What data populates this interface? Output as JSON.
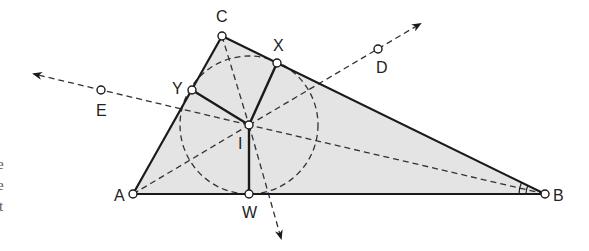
{
  "figure": {
    "type": "incircle-construction",
    "colors": {
      "stroke": "#1a1a1a",
      "dash": "#333333",
      "fill": "#e4e4e4",
      "background": "#ffffff"
    }
  },
  "points": {
    "A": {
      "label": "A",
      "x": 133,
      "y": 194
    },
    "B": {
      "label": "B",
      "x": 545,
      "y": 194
    },
    "C": {
      "label": "C",
      "x": 222,
      "y": 36
    },
    "I": {
      "label": "I",
      "x": 249,
      "y": 125
    },
    "W": {
      "label": "W",
      "x": 249,
      "y": 194
    },
    "X": {
      "label": "X",
      "x": 277,
      "y": 63
    },
    "Y": {
      "label": "Y",
      "x": 192,
      "y": 90
    },
    "D": {
      "label": "D",
      "x": 378,
      "y": 49
    },
    "E": {
      "label": "E",
      "x": 101,
      "y": 90
    }
  },
  "labels": {
    "A": "A",
    "B": "B",
    "C": "C",
    "I": "I",
    "W": "W",
    "X": "X",
    "Y": "Y",
    "D": "D",
    "E": "E"
  },
  "incircle": {
    "cx": 249,
    "cy": 125,
    "r": 69
  },
  "margin_fragments": [
    "e",
    "e",
    "t"
  ]
}
